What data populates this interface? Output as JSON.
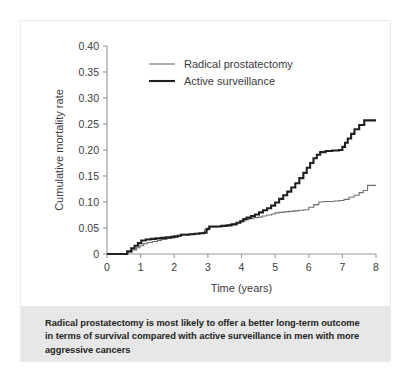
{
  "figure": {
    "caption": "Radical prostatectomy is most likely to offer a better long-term outcome in terms of survival compared with active surveillance in men with more aggressive cancers",
    "caption_background": "#e7e7e8",
    "frame_border_color": "#ececed",
    "background": "#ffffff"
  },
  "chart_data": {
    "type": "line",
    "subtype": "kaplan-meier-step",
    "title": "",
    "xlabel": "Time (years)",
    "ylabel": "Cumulative mortality rate",
    "xlim": [
      0,
      8
    ],
    "ylim": [
      0,
      0.4
    ],
    "grid": false,
    "legend_position": "top-center",
    "xticks": [
      0,
      1,
      2,
      3,
      4,
      5,
      6,
      7,
      8
    ],
    "xtick_labels": [
      "0",
      "1",
      "2",
      "3",
      "4",
      "5",
      "6",
      "7",
      "8"
    ],
    "yticks": [
      0,
      0.05,
      0.1,
      0.15,
      0.2,
      0.25,
      0.3,
      0.35,
      0.4
    ],
    "ytick_labels": [
      "0",
      "0.05",
      "0.10",
      "0.15",
      "0.20",
      "0.25",
      "0.30",
      "0.35",
      "0.40"
    ],
    "series": [
      {
        "name": "Radical prostatectomy",
        "color": "#6e6e70",
        "line_width": 1.1,
        "x": [
          0,
          0.45,
          0.62,
          0.75,
          0.88,
          0.98,
          1.08,
          1.2,
          1.35,
          1.5,
          1.62,
          1.78,
          1.9,
          2.02,
          2.12,
          2.2,
          2.3,
          2.42,
          2.55,
          2.68,
          2.8,
          2.9,
          3.0,
          3.08,
          3.18,
          3.3,
          3.45,
          3.6,
          3.75,
          3.88,
          4.0,
          4.1,
          4.22,
          4.35,
          4.5,
          4.62,
          4.75,
          4.9,
          5.0,
          5.12,
          5.25,
          5.4,
          5.55,
          5.7,
          5.85,
          6.0,
          6.15,
          6.3,
          6.45,
          6.6,
          6.75,
          6.9,
          7.05,
          7.2,
          7.35,
          7.5,
          7.62,
          7.75,
          8.0
        ],
        "y": [
          0,
          0,
          0.004,
          0.008,
          0.012,
          0.016,
          0.02,
          0.022,
          0.024,
          0.026,
          0.028,
          0.03,
          0.031,
          0.032,
          0.036,
          0.038,
          0.038,
          0.038,
          0.039,
          0.04,
          0.041,
          0.046,
          0.05,
          0.052,
          0.052,
          0.053,
          0.054,
          0.056,
          0.058,
          0.06,
          0.063,
          0.066,
          0.068,
          0.07,
          0.071,
          0.073,
          0.075,
          0.077,
          0.079,
          0.08,
          0.081,
          0.082,
          0.083,
          0.084,
          0.085,
          0.09,
          0.095,
          0.1,
          0.101,
          0.101,
          0.102,
          0.103,
          0.105,
          0.109,
          0.113,
          0.118,
          0.122,
          0.132,
          0.132
        ]
      },
      {
        "name": "Active surveillance",
        "color": "#231f20",
        "line_width": 2.1,
        "x": [
          0,
          0.45,
          0.6,
          0.72,
          0.82,
          0.92,
          1.02,
          1.15,
          1.3,
          1.45,
          1.6,
          1.75,
          1.9,
          2.0,
          2.1,
          2.2,
          2.32,
          2.45,
          2.6,
          2.75,
          2.88,
          2.96,
          3.04,
          3.14,
          3.26,
          3.4,
          3.55,
          3.7,
          3.85,
          3.96,
          4.05,
          4.15,
          4.28,
          4.4,
          4.52,
          4.64,
          4.76,
          4.88,
          5.0,
          5.12,
          5.24,
          5.36,
          5.48,
          5.6,
          5.72,
          5.84,
          5.94,
          6.04,
          6.14,
          6.24,
          6.34,
          6.5,
          6.7,
          6.9,
          7.0,
          7.08,
          7.16,
          7.26,
          7.36,
          7.5,
          7.65,
          8.0
        ],
        "y": [
          0,
          0,
          0.005,
          0.011,
          0.016,
          0.021,
          0.026,
          0.028,
          0.029,
          0.03,
          0.031,
          0.032,
          0.033,
          0.034,
          0.035,
          0.037,
          0.037,
          0.038,
          0.039,
          0.04,
          0.041,
          0.048,
          0.053,
          0.053,
          0.053,
          0.054,
          0.055,
          0.057,
          0.06,
          0.063,
          0.067,
          0.07,
          0.073,
          0.076,
          0.08,
          0.084,
          0.088,
          0.093,
          0.099,
          0.106,
          0.113,
          0.12,
          0.128,
          0.136,
          0.146,
          0.156,
          0.166,
          0.175,
          0.184,
          0.191,
          0.196,
          0.198,
          0.199,
          0.2,
          0.206,
          0.214,
          0.222,
          0.231,
          0.24,
          0.248,
          0.257,
          0.257
        ]
      }
    ]
  },
  "legend": {
    "items": [
      {
        "label": "Radical prostatectomy",
        "color": "#6e6e70",
        "line_width": 1.1
      },
      {
        "label": "Active surveillance",
        "color": "#231f20",
        "line_width": 2.1
      }
    ]
  }
}
